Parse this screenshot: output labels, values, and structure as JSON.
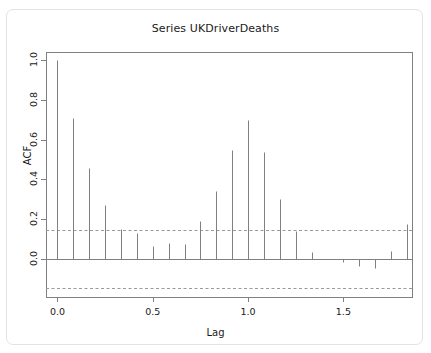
{
  "chart_data": {
    "type": "bar",
    "plot_style": "acf-stem",
    "title": "Series  UKDriverDeaths",
    "xlabel": "Lag",
    "ylabel": "ACF",
    "grid": false,
    "legend": null,
    "xlim": [
      -0.06,
      1.86
    ],
    "ylim": [
      -0.19,
      1.04
    ],
    "xticks": [
      0.0,
      0.5,
      1.0,
      1.5
    ],
    "xtick_labels": [
      "0.0",
      "0.5",
      "1.0",
      "1.5"
    ],
    "yticks": [
      0.0,
      0.2,
      0.4,
      0.6,
      0.8,
      1.0
    ],
    "ytick_labels": [
      "0.0",
      "0.2",
      "0.4",
      "0.6",
      "0.8",
      "1.0"
    ],
    "confidence_bands": [
      0.145,
      -0.145
    ],
    "zero_line": 0.0,
    "series_name": "ACF",
    "x": [
      0.0,
      0.0833,
      0.1667,
      0.25,
      0.3333,
      0.4167,
      0.5,
      0.5833,
      0.6667,
      0.75,
      0.8333,
      0.9167,
      1.0,
      1.0833,
      1.1667,
      1.25,
      1.3333,
      1.4167,
      1.5,
      1.5833,
      1.6667,
      1.75,
      1.8333
    ],
    "values": [
      1.0,
      0.71,
      0.46,
      0.27,
      0.15,
      0.13,
      0.065,
      0.08,
      0.075,
      0.19,
      0.34,
      0.55,
      0.7,
      0.54,
      0.3,
      0.14,
      0.035,
      0.0,
      -0.015,
      -0.035,
      -0.045,
      0.04,
      0.175
    ],
    "lag_labels": [
      "0",
      "1",
      "2",
      "3",
      "4",
      "5",
      "6",
      "7",
      "8",
      "9",
      "10",
      "11",
      "12",
      "13",
      "14",
      "15",
      "16",
      "17",
      "18",
      "19",
      "20",
      "21",
      "22"
    ],
    "colors": {
      "spike": "#808080",
      "axis": "#808080",
      "confidence": "#9a9a9a",
      "text": "#1a1a1a",
      "background": "#ffffff",
      "card_border": "#e3e3e3"
    }
  }
}
